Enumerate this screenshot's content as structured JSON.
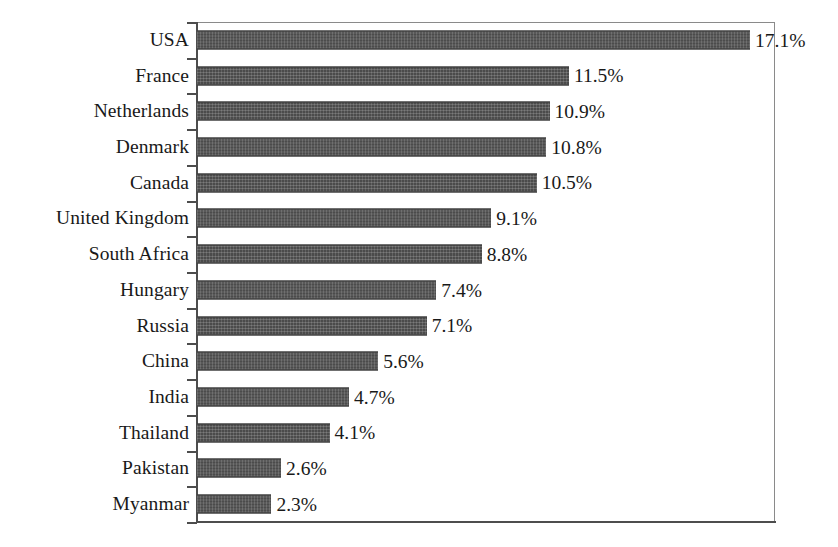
{
  "chart_data": {
    "type": "bar",
    "orientation": "horizontal",
    "title": "",
    "subtitle": "",
    "xlabel": "",
    "ylabel": "",
    "xlim": [
      0,
      17.9
    ],
    "grid": false,
    "legend": null,
    "value_suffix": "%",
    "categories": [
      "USA",
      "France",
      "Netherlands",
      "Denmark",
      "Canada",
      "United Kingdom",
      "South Africa",
      "Hungary",
      "Russia",
      "China",
      "India",
      "Thailand",
      "Pakistan",
      "Myanmar"
    ],
    "values": [
      17.1,
      11.5,
      10.9,
      10.8,
      10.5,
      9.1,
      8.8,
      7.4,
      7.1,
      5.6,
      4.7,
      4.1,
      2.6,
      2.3
    ],
    "data_labels": [
      "17.1%",
      "11.5%",
      "10.9%",
      "10.8%",
      "10.5%",
      "9.1%",
      "8.8%",
      "7.4%",
      "7.1%",
      "5.6%",
      "4.7%",
      "4.1%",
      "2.6%",
      "2.3%"
    ],
    "colors": {
      "bar_fill": "#4b4b4b",
      "bar_edge": "#3c3c3c",
      "axis": "#4d4d4d",
      "frame": "#8a8a8a",
      "text": "#191919",
      "background": "#ffffff"
    }
  }
}
